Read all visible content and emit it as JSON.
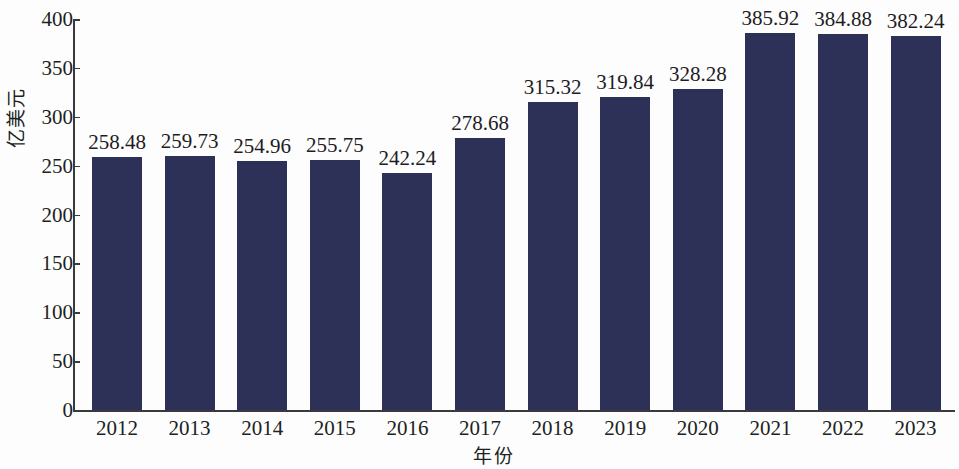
{
  "chart_data": {
    "type": "bar",
    "title": "",
    "subtitle": "",
    "xlabel": "年份",
    "ylabel": "亿美元",
    "categories": [
      "2012",
      "2013",
      "2014",
      "2015",
      "2016",
      "2017",
      "2018",
      "2019",
      "2020",
      "2021",
      "2022",
      "2023"
    ],
    "values": [
      258.48,
      259.73,
      254.96,
      255.75,
      242.24,
      278.68,
      315.32,
      319.84,
      328.28,
      385.92,
      384.88,
      382.24
    ],
    "value_labels": [
      "258.48",
      "259.73",
      "254.96",
      "255.75",
      "242.24",
      "278.68",
      "315.32",
      "319.84",
      "328.28",
      "385.92",
      "384.88",
      "382.24"
    ],
    "ylim": [
      0,
      400
    ],
    "ytick_labels": [
      "0",
      "50",
      "100",
      "150",
      "200",
      "250",
      "300",
      "350",
      "400"
    ],
    "ytick_values": [
      0,
      50,
      100,
      150,
      200,
      250,
      300,
      350,
      400
    ],
    "grid": false,
    "legend": false,
    "legend_position": "none",
    "bar_color": "#2e3157",
    "background_color": "#fdfdfd",
    "axis_color": "#3a3a3e",
    "text_color": "#201f22",
    "series": [
      {
        "name": "亿美元",
        "values": [
          258.48,
          259.73,
          254.96,
          255.75,
          242.24,
          278.68,
          315.32,
          319.84,
          328.28,
          385.92,
          384.88,
          382.24
        ]
      }
    ]
  }
}
